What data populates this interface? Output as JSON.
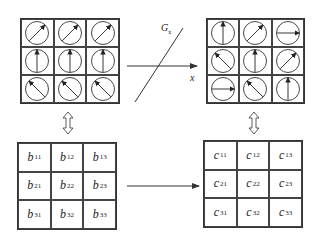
{
  "diagram": {
    "type": "transformation-flow",
    "colors": {
      "line": "#333333",
      "background": "#ffffff"
    },
    "input_grid": {
      "description": "3x3 grid of circles with direction arrows (input orientation field)",
      "rows": [
        [
          "NE",
          "NE",
          "NE"
        ],
        [
          "N",
          "N",
          "N"
        ],
        [
          "NW",
          "NW",
          "NW"
        ]
      ]
    },
    "output_grid": {
      "description": "3x3 grid of circles with direction arrows (transformed orientation field)",
      "rows": [
        [
          "N",
          "NE",
          "E"
        ],
        [
          "NW",
          "N",
          "NE"
        ],
        [
          "E",
          "NW",
          "N"
        ]
      ]
    },
    "transform": {
      "operator_label": "G",
      "operator_subscript": "x",
      "axis_label": "x",
      "arrow_icon": "right-arrow-icon",
      "line_icon": "diagonal-line-icon"
    },
    "correspondence_icon": "double-vertical-arrow-icon",
    "input_matrix": {
      "symbol": "b",
      "cells": [
        [
          "11",
          "12",
          "13"
        ],
        [
          "21",
          "22",
          "23"
        ],
        [
          "31",
          "32",
          "33"
        ]
      ]
    },
    "output_matrix": {
      "symbol": "c",
      "cells": [
        [
          "11",
          "12",
          "13"
        ],
        [
          "21",
          "22",
          "23"
        ],
        [
          "31",
          "32",
          "33"
        ]
      ]
    },
    "matrix_map_icon": "right-arrow-icon"
  }
}
